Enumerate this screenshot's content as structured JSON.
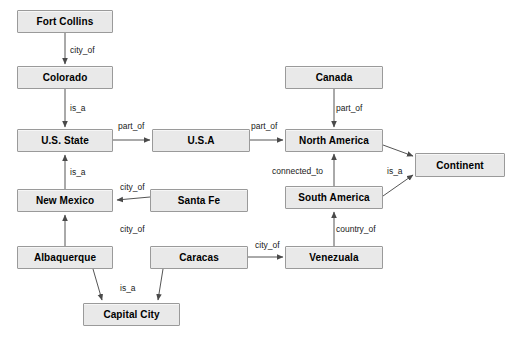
{
  "diagram": {
    "canvas": {
      "width": 521,
      "height": 337,
      "background": "#ffffff"
    },
    "style": {
      "node_fill": "#e9e9e9",
      "node_border": "#9a9a9a",
      "edge_color": "#555555",
      "text_color": "#000000"
    },
    "nodes": [
      {
        "id": "fort_collins",
        "label": "Fort Collins",
        "x": 17,
        "y": 10,
        "w": 96,
        "h": 23
      },
      {
        "id": "colorado",
        "label": "Colorado",
        "x": 17,
        "y": 66,
        "w": 96,
        "h": 23
      },
      {
        "id": "us_state",
        "label": "U.S. State",
        "x": 17,
        "y": 129,
        "w": 96,
        "h": 23
      },
      {
        "id": "usa",
        "label": "U.S.A",
        "x": 152,
        "y": 129,
        "w": 98,
        "h": 23
      },
      {
        "id": "canada",
        "label": "Canada",
        "x": 285,
        "y": 66,
        "w": 98,
        "h": 23
      },
      {
        "id": "north_america",
        "label": "North America",
        "x": 285,
        "y": 129,
        "w": 98,
        "h": 23
      },
      {
        "id": "continent",
        "label": "Continent",
        "x": 415,
        "y": 153,
        "w": 90,
        "h": 24
      },
      {
        "id": "south_america",
        "label": "South America",
        "x": 285,
        "y": 186,
        "w": 98,
        "h": 23
      },
      {
        "id": "new_mexico",
        "label": "New Mexico",
        "x": 17,
        "y": 189,
        "w": 96,
        "h": 23
      },
      {
        "id": "santa_fe",
        "label": "Santa Fe",
        "x": 150,
        "y": 189,
        "w": 98,
        "h": 23
      },
      {
        "id": "albaquerque",
        "label": "Albaquerque",
        "x": 17,
        "y": 246,
        "w": 96,
        "h": 23
      },
      {
        "id": "caracas",
        "label": "Caracas",
        "x": 150,
        "y": 246,
        "w": 98,
        "h": 23
      },
      {
        "id": "venezuala",
        "label": "Venezuala",
        "x": 285,
        "y": 246,
        "w": 98,
        "h": 23
      },
      {
        "id": "capital_city",
        "label": "Capital City",
        "x": 83,
        "y": 303,
        "w": 97,
        "h": 23
      }
    ],
    "edges": [
      {
        "id": "e1",
        "from": "fort_collins",
        "to": "colorado",
        "label": "city_of",
        "label_x": 70,
        "label_y": 45
      },
      {
        "id": "e2",
        "from": "colorado",
        "to": "us_state",
        "label": "is_a",
        "label_x": 70,
        "label_y": 103
      },
      {
        "id": "e3",
        "from": "us_state",
        "to": "usa",
        "label": "part_of",
        "label_x": 118,
        "label_y": 121
      },
      {
        "id": "e4",
        "from": "usa",
        "to": "north_america",
        "label": "part_of",
        "label_x": 251,
        "label_y": 121
      },
      {
        "id": "e5",
        "from": "canada",
        "to": "north_america",
        "label": "part_of",
        "label_x": 336,
        "label_y": 103
      },
      {
        "id": "e6",
        "from": "north_america",
        "to": "continent",
        "label": "is_a",
        "label_x": 387,
        "label_y": 166
      },
      {
        "id": "e7",
        "from": "south_america",
        "to": "continent",
        "label": "",
        "label_x": 0,
        "label_y": 0
      },
      {
        "id": "e8",
        "from": "south_america",
        "to": "north_america",
        "label": "connected_to",
        "label_x": 272,
        "label_y": 166
      },
      {
        "id": "e9",
        "from": "new_mexico",
        "to": "us_state",
        "label": "is_a",
        "label_x": 70,
        "label_y": 167
      },
      {
        "id": "e10",
        "from": "santa_fe",
        "to": "new_mexico",
        "label": "city_of",
        "label_x": 120,
        "label_y": 182
      },
      {
        "id": "e11",
        "from": "albaquerque",
        "to": "new_mexico",
        "label": "city_of",
        "label_x": 120,
        "label_y": 224
      },
      {
        "id": "e12",
        "from": "albaquerque",
        "to": "capital_city",
        "label": "is_a",
        "label_x": 120,
        "label_y": 283
      },
      {
        "id": "e13",
        "from": "caracas",
        "to": "capital_city",
        "label": "",
        "label_x": 0,
        "label_y": 0
      },
      {
        "id": "e14",
        "from": "caracas",
        "to": "venezuala",
        "label": "city_of",
        "label_x": 255,
        "label_y": 240
      },
      {
        "id": "e15",
        "from": "venezuala",
        "to": "south_america",
        "label": "country_of",
        "label_x": 336,
        "label_y": 224
      }
    ],
    "edge_paths": [
      {
        "id": "e1",
        "d": "M 65,33 L 65,64",
        "arrow": "down",
        "ax": 65,
        "ay": 65
      },
      {
        "id": "e2",
        "d": "M 65,89 L 65,127",
        "arrow": "down",
        "ax": 65,
        "ay": 128
      },
      {
        "id": "e3",
        "d": "M 113,140 L 150,140",
        "arrow": "right",
        "ax": 151,
        "ay": 140
      },
      {
        "id": "e4",
        "d": "M 250,140 L 283,140",
        "arrow": "right",
        "ax": 284,
        "ay": 140
      },
      {
        "id": "e5",
        "d": "M 334,89 L 334,127",
        "arrow": "down",
        "ax": 334,
        "ay": 128
      },
      {
        "id": "e6",
        "d": "M 383,145 L 413,156",
        "arrow": "diag-dn",
        "ax": 414,
        "ay": 157
      },
      {
        "id": "e7",
        "d": "M 383,196 L 413,175",
        "arrow": "diag-up",
        "ax": 414,
        "ay": 174
      },
      {
        "id": "e8",
        "d": "M 334,186 L 334,154",
        "arrow": "up",
        "ax": 334,
        "ay": 153
      },
      {
        "id": "e9",
        "d": "M 65,189 L 65,155",
        "arrow": "up",
        "ax": 65,
        "ay": 154
      },
      {
        "id": "e10",
        "d": "M 150,197 L 117,200",
        "arrow": "left",
        "ax": 115,
        "ay": 200
      },
      {
        "id": "e11",
        "d": "M 65,246 L 65,215",
        "arrow": "up",
        "ax": 65,
        "ay": 214
      },
      {
        "id": "e12",
        "d": "M 93,269 L 102,300",
        "arrow": "down",
        "ax": 102,
        "ay": 301
      },
      {
        "id": "e13",
        "d": "M 163,269 L 158,300",
        "arrow": "down",
        "ax": 158,
        "ay": 301
      },
      {
        "id": "e14",
        "d": "M 248,257 L 283,257",
        "arrow": "right",
        "ax": 284,
        "ay": 257
      },
      {
        "id": "e15",
        "d": "M 334,246 L 334,212",
        "arrow": "up",
        "ax": 334,
        "ay": 211
      }
    ]
  }
}
